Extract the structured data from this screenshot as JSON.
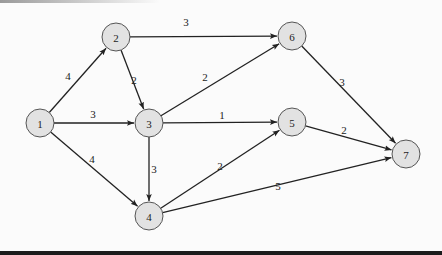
{
  "diagram": {
    "type": "directed-weighted-graph",
    "node_fill": "#e2e2e2",
    "node_stroke": "#555555",
    "edge_color": "#222222",
    "nodes": [
      {
        "id": "1",
        "label": "1",
        "x": 40,
        "y": 123
      },
      {
        "id": "2",
        "label": "2",
        "x": 116,
        "y": 37
      },
      {
        "id": "3",
        "label": "3",
        "x": 149,
        "y": 123
      },
      {
        "id": "4",
        "label": "4",
        "x": 149,
        "y": 216
      },
      {
        "id": "5",
        "label": "5",
        "x": 292,
        "y": 122
      },
      {
        "id": "6",
        "label": "6",
        "x": 292,
        "y": 36
      },
      {
        "id": "7",
        "label": "7",
        "x": 406,
        "y": 154
      }
    ],
    "edges": [
      {
        "from": "1",
        "to": "2",
        "weight": "4",
        "lx": 68,
        "ly": 76
      },
      {
        "from": "1",
        "to": "3",
        "weight": "3",
        "lx": 93,
        "ly": 114
      },
      {
        "from": "1",
        "to": "4",
        "weight": "4",
        "lx": 92,
        "ly": 159
      },
      {
        "from": "2",
        "to": "6",
        "weight": "3",
        "lx": 186,
        "ly": 22
      },
      {
        "from": "2",
        "to": "3",
        "weight": "2",
        "lx": 134,
        "ly": 80
      },
      {
        "from": "3",
        "to": "6",
        "weight": "2",
        "lx": 205,
        "ly": 77
      },
      {
        "from": "3",
        "to": "5",
        "weight": "1",
        "lx": 222,
        "ly": 115
      },
      {
        "from": "3",
        "to": "4",
        "weight": "3",
        "lx": 154,
        "ly": 169
      },
      {
        "from": "4",
        "to": "5",
        "weight": "2",
        "lx": 220,
        "ly": 166
      },
      {
        "from": "4",
        "to": "7",
        "weight": "5",
        "lx": 278,
        "ly": 186
      },
      {
        "from": "6",
        "to": "7",
        "weight": "3",
        "lx": 342,
        "ly": 82
      },
      {
        "from": "5",
        "to": "7",
        "weight": "2",
        "lx": 344,
        "ly": 130
      }
    ]
  }
}
